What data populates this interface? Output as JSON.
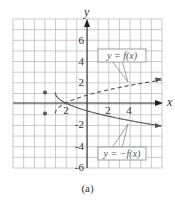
{
  "chart_data": {
    "type": "line",
    "title": "",
    "caption": "(a)",
    "xlabel": "x",
    "ylabel": "y",
    "xlim": [
      -7,
      7
    ],
    "ylim": [
      -7,
      7
    ],
    "grid": true,
    "x_ticks": [
      -2,
      2,
      4
    ],
    "x_tick_labels": [
      "-2",
      "2",
      "4"
    ],
    "y_ticks": [
      6,
      4,
      2,
      -2,
      -4,
      -6
    ],
    "y_tick_labels": [
      "6",
      "4",
      "2",
      "-2",
      "-4",
      "-6"
    ],
    "series": [
      {
        "name": "y = f(x)",
        "style": "dashed",
        "start_point": [
          -3,
          -1
        ],
        "x": [
          -3,
          -2,
          0,
          2,
          4,
          6,
          7
        ],
        "values": [
          -1,
          0,
          0.73,
          1.24,
          1.65,
          2.0,
          2.16
        ]
      },
      {
        "name": "y = −f(x)",
        "style": "solid",
        "start_point": [
          -3,
          1
        ],
        "x": [
          -3,
          -2,
          0,
          2,
          4,
          6,
          7
        ],
        "values": [
          1,
          0,
          -0.73,
          -1.24,
          -1.65,
          -2.0,
          -2.16
        ]
      }
    ],
    "annotations": [
      {
        "text": "y = f(x)",
        "position": "upper-right",
        "points_to": [
          4,
          1.7
        ]
      },
      {
        "text": "y = −f(x)",
        "position": "lower-right",
        "points_to": [
          4,
          -1.7
        ]
      }
    ]
  },
  "labels": {
    "x_axis": "x",
    "y_axis": "y",
    "f_label": "y = f(x)",
    "neg_f_label": "y = −f(x)",
    "caption": "(a)",
    "tick_x_neg2": "2",
    "tick_x_2": "2",
    "tick_x_4": "4",
    "tick_y_6": "6",
    "tick_y_4": "4",
    "tick_y_2": "2",
    "tick_y_neg2": "-2",
    "tick_y_neg4": "-4",
    "tick_y_neg6": "-6"
  },
  "colors": {
    "grid": "#b8b8b8",
    "axis": "#333333",
    "curve": "#555555",
    "label_box": "#888888"
  }
}
